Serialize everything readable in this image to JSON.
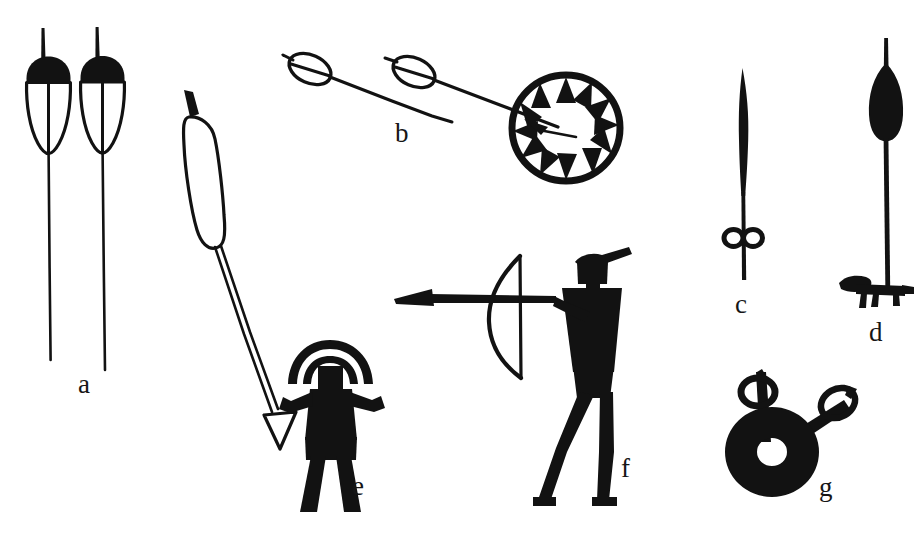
{
  "plate": {
    "width": 924,
    "height": 536,
    "background_color": "#ffffff",
    "ink_color": "#121212",
    "description": "Archaeological line-drawing plate of hunting weapons and hunter figures"
  },
  "items": [
    {
      "key": "a",
      "label": "a",
      "name": "two-toggling-harpoon-heads",
      "label_x": 78,
      "label_y": 371
    },
    {
      "key": "b",
      "label": "b",
      "name": "two-barbed-shafts-and-spoked-ring",
      "label_x": 395,
      "label_y": 120
    },
    {
      "key": "c",
      "label": "c",
      "name": "narrow-blade-point-with-double-loop",
      "label_x": 735,
      "label_y": 291
    },
    {
      "key": "d",
      "label": "d",
      "name": "leaf-point-shaft-with-crossbar-fitting",
      "label_x": 869,
      "label_y": 319
    },
    {
      "key": "e",
      "label": "e",
      "name": "harpooner-with-float-and-arrow",
      "label_x": 352,
      "label_y": 473
    },
    {
      "key": "f",
      "label": "f",
      "name": "archer-drawing-bow",
      "label_x": 621,
      "label_y": 455
    },
    {
      "key": "g",
      "label": "g",
      "name": "perforated-disc-with-two-loop-rods",
      "label_x": 819,
      "label_y": 474
    }
  ]
}
